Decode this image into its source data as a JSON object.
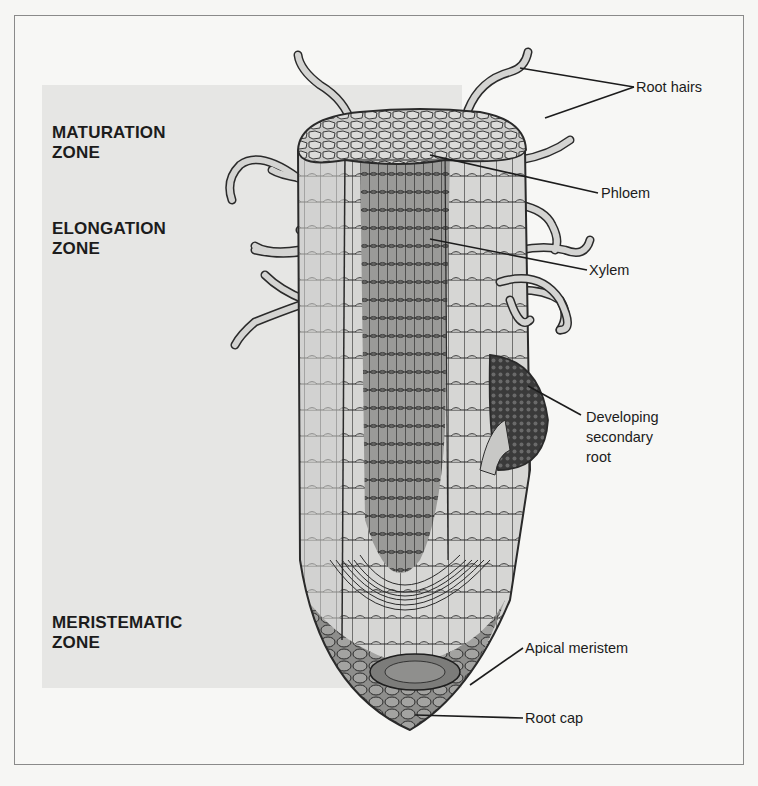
{
  "figure": {
    "zones": [
      {
        "id": "maturation",
        "lines": [
          "MATURATION",
          "ZONE"
        ]
      },
      {
        "id": "elongation",
        "lines": [
          "ELONGATION",
          "ZONE"
        ]
      },
      {
        "id": "meristematic",
        "lines": [
          "MERISTEMATIC",
          "ZONE"
        ]
      }
    ],
    "callouts": [
      {
        "id": "root-hairs",
        "lines": [
          "Root hairs"
        ]
      },
      {
        "id": "phloem",
        "lines": [
          "Phloem"
        ]
      },
      {
        "id": "xylem",
        "lines": [
          "Xylem"
        ]
      },
      {
        "id": "developing-secondary-root",
        "lines": [
          "Developing",
          "secondary",
          "root"
        ]
      },
      {
        "id": "apical-meristem",
        "lines": [
          "Apical meristem"
        ]
      },
      {
        "id": "root-cap",
        "lines": [
          "Root cap"
        ]
      }
    ],
    "colors": {
      "panel": "#e6e6e4",
      "background": "#f7f7f5",
      "outline": "#2a2a2a",
      "cell_light": "#d9d9d7",
      "cell_mid": "#a9a9a7",
      "cell_dark": "#6f6f6d",
      "text": "#1c1c1c"
    }
  }
}
